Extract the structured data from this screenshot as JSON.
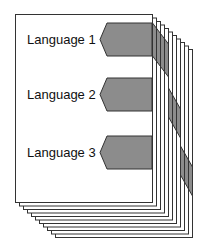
{
  "diagram": {
    "page_count": 11,
    "colors": {
      "page_fill": "#ffffff",
      "page_stroke": "#333333",
      "tab_fill": "#8c8c8c",
      "tab_stroke": "#333333",
      "text": "#111111"
    },
    "sections": [
      {
        "label": "Language 1"
      },
      {
        "label": "Language 2"
      },
      {
        "label": "Language 3"
      }
    ]
  }
}
